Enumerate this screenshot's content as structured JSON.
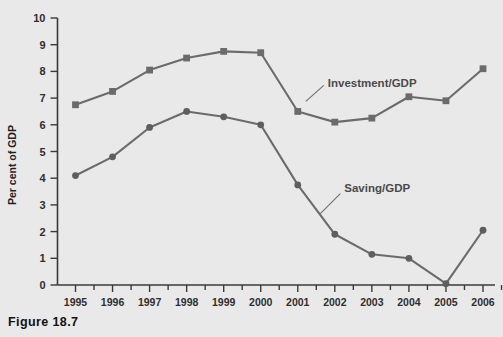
{
  "caption": "Figure 18.7",
  "chart_data": {
    "type": "line",
    "title": "",
    "xlabel": "",
    "ylabel": "Per cent of GDP",
    "categories": [
      "1995",
      "1996",
      "1997",
      "1998",
      "1999",
      "2000",
      "2001",
      "2002",
      "2003",
      "2004",
      "2005",
      "2006"
    ],
    "x": [
      1995,
      1996,
      1997,
      1998,
      1999,
      2000,
      2001,
      2002,
      2003,
      2004,
      2005,
      2006
    ],
    "ylim": [
      0,
      10
    ],
    "yticks": [
      0,
      1,
      2,
      3,
      4,
      5,
      6,
      7,
      8,
      9,
      10
    ],
    "grid": false,
    "legend_position": "inline-annotations",
    "series": [
      {
        "name": "Investment/GDP",
        "marker": "square",
        "color": "#6b6b6b",
        "values": [
          6.75,
          7.25,
          8.05,
          8.5,
          8.75,
          8.7,
          6.5,
          6.1,
          6.25,
          7.05,
          6.9,
          8.1
        ]
      },
      {
        "name": "Saving/GDP",
        "marker": "circle",
        "color": "#5e5e5e",
        "values": [
          4.1,
          4.8,
          5.9,
          6.5,
          6.3,
          6.0,
          3.75,
          1.9,
          1.15,
          1.0,
          0.05,
          2.05
        ]
      }
    ],
    "annotations": [
      {
        "text": "Investment/GDP",
        "series": "Investment/GDP"
      },
      {
        "text": "Saving/GDP",
        "series": "Saving/GDP"
      }
    ]
  }
}
